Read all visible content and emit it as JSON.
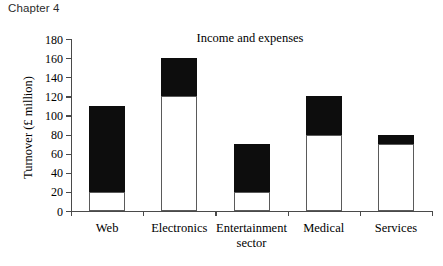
{
  "page": {
    "chapter_heading": "Chapter 4"
  },
  "chart_data": {
    "type": "bar",
    "subtype": "stacked-bar",
    "title": "Income and expenses",
    "xlabel": "",
    "ylabel": "Turnover (£ million)",
    "ylim": [
      0,
      180
    ],
    "ytick_step": 20,
    "yticks": [
      0,
      20,
      40,
      60,
      80,
      100,
      120,
      140,
      160,
      180
    ],
    "ytick_labels": [
      "0",
      "20",
      "40",
      "60",
      "80",
      "100",
      "120",
      "140",
      "160",
      "180"
    ],
    "grid": false,
    "legend": null,
    "categories": [
      "Web",
      "Electronics",
      "Entertainment sector",
      "Medical",
      "Services"
    ],
    "category_label_lines": [
      [
        "Web"
      ],
      [
        "Electronics"
      ],
      [
        "Entertainment",
        "sector"
      ],
      [
        "Medical"
      ],
      [
        "Services"
      ]
    ],
    "series": [
      {
        "name": "lower",
        "color": "#ffffff",
        "values": [
          20,
          120,
          20,
          80,
          70
        ]
      },
      {
        "name": "upper",
        "color": "#0d0d0d",
        "values": [
          90,
          40,
          50,
          40,
          10
        ]
      }
    ],
    "segment_boundaries": [
      {
        "category": "Web",
        "lower_top": 20,
        "total": 110
      },
      {
        "category": "Electronics",
        "lower_top": 120,
        "total": 160
      },
      {
        "category": "Entertainment sector",
        "lower_top": 20,
        "total": 70
      },
      {
        "category": "Medical",
        "lower_top": 80,
        "total": 120
      },
      {
        "category": "Services",
        "lower_top": 70,
        "total": 80
      }
    ],
    "totals": [
      110,
      160,
      70,
      120,
      80
    ]
  },
  "colors": {
    "axis": "#4a4a4a",
    "bar_outline": "#5a5a5a",
    "bar_upper": "#0d0d0d",
    "bar_lower": "#ffffff",
    "text": "#000000",
    "heading": "#2b2b2b"
  }
}
